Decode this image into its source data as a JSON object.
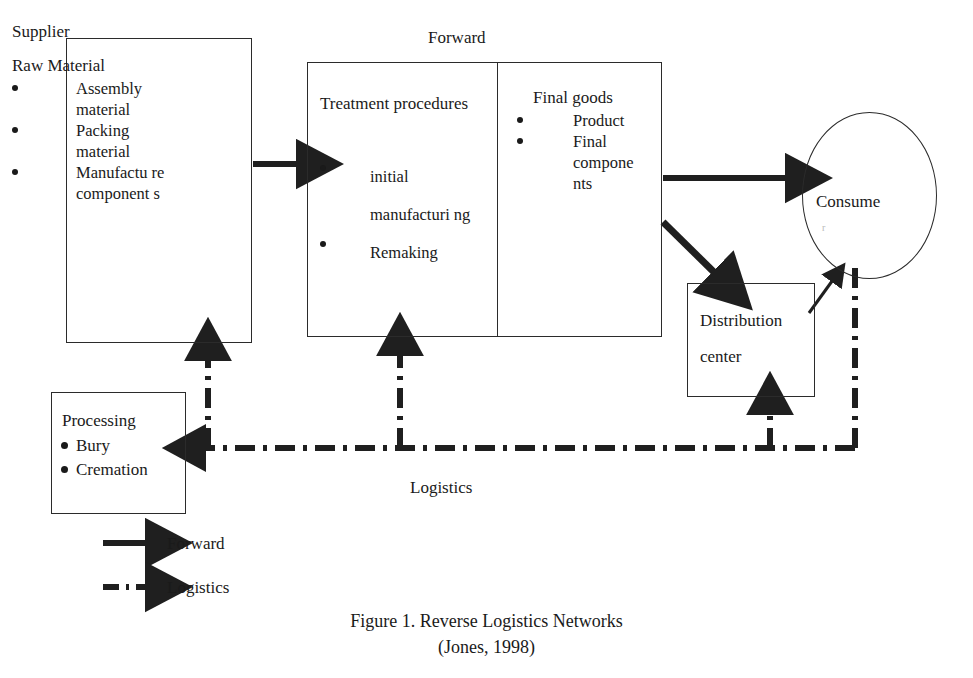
{
  "figure": {
    "top_label": "Forward",
    "middle_label": "Logistics",
    "caption_line1": "Figure 1. Reverse Logistics Networks",
    "caption_line2": "(Jones, 1998)"
  },
  "nodes": {
    "supplier": {
      "title": "Supplier",
      "subtitle": "Raw Material",
      "bullets": [
        "Assembly material",
        "Packing material",
        "Manufactu re component s"
      ]
    },
    "treatment": {
      "title": "Treatment procedures",
      "bullets": [
        "initial manufacturi ng",
        "Remaking"
      ]
    },
    "final_goods": {
      "title": "Final goods",
      "bullets": [
        "Product",
        "Final compone nts"
      ]
    },
    "consumer": {
      "label": "Consume",
      "label_wrap": "r"
    },
    "distribution_center": {
      "line1": "Distribution",
      "line2": "center"
    },
    "processing": {
      "title": "Processing",
      "bullets": [
        "Bury",
        "Cremation"
      ]
    }
  },
  "legend": {
    "items": [
      {
        "label": "Forward",
        "style": "solid-arrow"
      },
      {
        "label": "Logistics",
        "style": "dash-dot-arrow"
      }
    ]
  },
  "colors": {
    "stroke": "#2b2b2b",
    "text": "#1a1a1a",
    "background": "#ffffff"
  }
}
